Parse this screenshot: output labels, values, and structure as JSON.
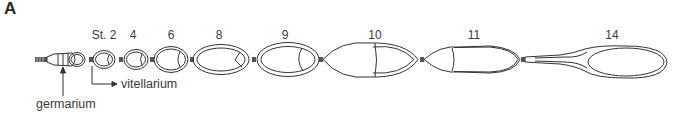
{
  "figure": {
    "panel_label": "A",
    "stage_label_prefix": "St. 2",
    "stages": [
      {
        "label": "St. 2",
        "x": 104
      },
      {
        "label": "4",
        "x": 133
      },
      {
        "label": "6",
        "x": 171
      },
      {
        "label": "8",
        "x": 219
      },
      {
        "label": "9",
        "x": 285
      },
      {
        "label": "10",
        "x": 375
      },
      {
        "label": "11",
        "x": 474
      },
      {
        "label": "14",
        "x": 612
      }
    ],
    "annotations": {
      "vitellarium": "vitellarium",
      "germarium": "germarium"
    },
    "line_color": "#333333"
  }
}
